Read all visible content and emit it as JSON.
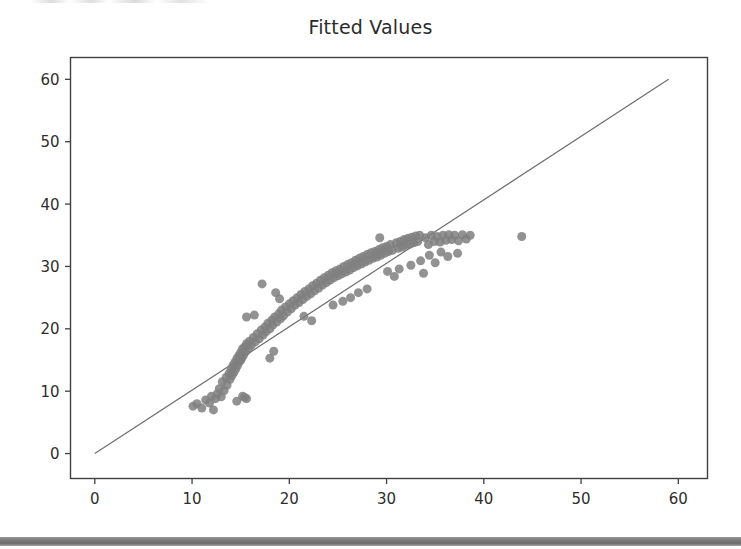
{
  "figure": {
    "title": "Fitted Values",
    "background_color": "#ffffff",
    "axes_color": "#404040",
    "tick_label_color": "#2e2e2e",
    "bottom_band_color": "#6f6f6f"
  },
  "chart_data": {
    "type": "scatter",
    "title": "Fitted Values",
    "xlabel": "",
    "ylabel": "",
    "xlim": [
      -2.5,
      63.0
    ],
    "ylim": [
      -4.0,
      63.5
    ],
    "xticks": [
      0,
      10,
      20,
      30,
      40,
      50,
      60
    ],
    "yticks": [
      0,
      10,
      20,
      30,
      40,
      50,
      60
    ],
    "xtick_labels": [
      "0",
      "10",
      "20",
      "30",
      "40",
      "50",
      "60"
    ],
    "ytick_labels": [
      "0",
      "10",
      "20",
      "30",
      "40",
      "50",
      "60"
    ],
    "grid": false,
    "legend": null,
    "marker": {
      "shape": "circle",
      "color": "#7f7f7f",
      "size": 9,
      "alpha": 0.85
    },
    "reference_line": {
      "name": "identity-line",
      "type": "line",
      "color": "#6e6e6e",
      "width": 1.2,
      "x": [
        0,
        59
      ],
      "y": [
        0,
        60
      ]
    },
    "series": [
      {
        "name": "observed-vs-fitted",
        "points": [
          [
            10.1,
            7.6
          ],
          [
            10.5,
            8.0
          ],
          [
            11.0,
            7.3
          ],
          [
            11.4,
            8.6
          ],
          [
            11.8,
            8.1
          ],
          [
            12.0,
            9.2
          ],
          [
            12.2,
            7.0
          ],
          [
            12.4,
            8.8
          ],
          [
            12.6,
            9.6
          ],
          [
            12.8,
            10.4
          ],
          [
            13.0,
            9.1
          ],
          [
            13.1,
            11.5
          ],
          [
            13.3,
            10.1
          ],
          [
            13.5,
            12.2
          ],
          [
            13.6,
            11.0
          ],
          [
            13.8,
            12.8
          ],
          [
            13.9,
            11.9
          ],
          [
            14.0,
            13.4
          ],
          [
            14.1,
            12.5
          ],
          [
            14.2,
            14.1
          ],
          [
            14.3,
            13.0
          ],
          [
            14.4,
            14.6
          ],
          [
            14.5,
            13.6
          ],
          [
            14.6,
            15.2
          ],
          [
            14.7,
            14.2
          ],
          [
            14.8,
            15.7
          ],
          [
            14.9,
            14.8
          ],
          [
            15.0,
            16.2
          ],
          [
            15.1,
            15.3
          ],
          [
            15.2,
            16.8
          ],
          [
            15.3,
            15.8
          ],
          [
            15.4,
            17.1
          ],
          [
            15.5,
            16.3
          ],
          [
            15.6,
            17.6
          ],
          [
            15.8,
            16.9
          ],
          [
            15.2,
            9.2
          ],
          [
            15.4,
            9.0
          ],
          [
            15.6,
            8.8
          ],
          [
            14.6,
            8.4
          ],
          [
            15.0,
            15.0
          ],
          [
            15.6,
            21.9
          ],
          [
            16.4,
            22.2
          ],
          [
            15.9,
            18.0
          ],
          [
            16.1,
            17.4
          ],
          [
            16.3,
            18.6
          ],
          [
            16.5,
            17.9
          ],
          [
            16.7,
            19.2
          ],
          [
            16.9,
            18.4
          ],
          [
            17.1,
            19.8
          ],
          [
            17.3,
            19.0
          ],
          [
            17.5,
            20.3
          ],
          [
            17.6,
            19.5
          ],
          [
            17.8,
            20.9
          ],
          [
            18.0,
            20.0
          ],
          [
            18.2,
            21.4
          ],
          [
            18.3,
            20.6
          ],
          [
            18.5,
            21.9
          ],
          [
            18.7,
            21.1
          ],
          [
            18.9,
            22.4
          ],
          [
            19.1,
            21.6
          ],
          [
            19.2,
            23.0
          ],
          [
            19.4,
            22.1
          ],
          [
            19.6,
            23.5
          ],
          [
            19.8,
            22.7
          ],
          [
            20.0,
            24.0
          ],
          [
            17.2,
            27.2
          ],
          [
            18.6,
            25.8
          ],
          [
            19.0,
            24.8
          ],
          [
            18.0,
            15.3
          ],
          [
            18.4,
            16.4
          ],
          [
            20.2,
            23.2
          ],
          [
            20.4,
            24.5
          ],
          [
            20.6,
            23.8
          ],
          [
            20.8,
            25.0
          ],
          [
            21.0,
            24.2
          ],
          [
            21.2,
            25.5
          ],
          [
            21.4,
            24.7
          ],
          [
            21.6,
            26.0
          ],
          [
            21.8,
            25.2
          ],
          [
            22.0,
            26.4
          ],
          [
            22.2,
            25.6
          ],
          [
            22.4,
            26.9
          ],
          [
            22.6,
            26.1
          ],
          [
            22.8,
            27.3
          ],
          [
            23.0,
            26.5
          ],
          [
            21.5,
            22.0
          ],
          [
            22.3,
            21.3
          ],
          [
            23.2,
            27.8
          ],
          [
            23.4,
            27.0
          ],
          [
            23.6,
            28.2
          ],
          [
            23.8,
            27.4
          ],
          [
            24.0,
            28.6
          ],
          [
            24.2,
            27.8
          ],
          [
            24.4,
            29.0
          ],
          [
            24.6,
            28.2
          ],
          [
            24.8,
            29.3
          ],
          [
            25.0,
            28.5
          ],
          [
            25.2,
            29.6
          ],
          [
            25.4,
            28.8
          ],
          [
            25.6,
            30.0
          ],
          [
            25.8,
            29.1
          ],
          [
            26.0,
            30.3
          ],
          [
            26.2,
            29.4
          ],
          [
            26.4,
            30.6
          ],
          [
            26.6,
            29.8
          ],
          [
            26.8,
            31.0
          ],
          [
            27.0,
            30.1
          ],
          [
            27.2,
            31.3
          ],
          [
            27.4,
            30.4
          ],
          [
            27.6,
            31.6
          ],
          [
            27.8,
            30.7
          ],
          [
            28.0,
            31.9
          ],
          [
            28.2,
            31.0
          ],
          [
            28.4,
            32.2
          ],
          [
            28.6,
            31.3
          ],
          [
            24.5,
            23.8
          ],
          [
            25.5,
            24.4
          ],
          [
            26.3,
            25.0
          ],
          [
            27.1,
            25.8
          ],
          [
            28.0,
            26.4
          ],
          [
            28.8,
            32.4
          ],
          [
            29.0,
            31.5
          ],
          [
            29.2,
            32.7
          ],
          [
            29.4,
            31.8
          ],
          [
            29.6,
            33.0
          ],
          [
            29.8,
            32.1
          ],
          [
            30.0,
            33.2
          ],
          [
            30.2,
            32.4
          ],
          [
            30.4,
            33.5
          ],
          [
            30.6,
            32.6
          ],
          [
            29.3,
            34.6
          ],
          [
            30.8,
            28.4
          ],
          [
            31.0,
            33.8
          ],
          [
            31.2,
            32.9
          ],
          [
            31.4,
            34.0
          ],
          [
            31.6,
            33.1
          ],
          [
            31.8,
            34.3
          ],
          [
            32.0,
            33.4
          ],
          [
            32.2,
            34.5
          ],
          [
            32.4,
            33.6
          ],
          [
            32.6,
            34.7
          ],
          [
            32.8,
            33.8
          ],
          [
            33.0,
            34.9
          ],
          [
            33.2,
            34.0
          ],
          [
            33.4,
            35.0
          ],
          [
            31.3,
            29.6
          ],
          [
            32.5,
            30.2
          ],
          [
            33.5,
            30.9
          ],
          [
            30.1,
            29.2
          ],
          [
            33.8,
            28.9
          ],
          [
            34.0,
            34.6
          ],
          [
            34.3,
            33.5
          ],
          [
            34.6,
            35.0
          ],
          [
            34.9,
            34.0
          ],
          [
            35.2,
            34.8
          ],
          [
            35.5,
            33.9
          ],
          [
            35.8,
            35.0
          ],
          [
            36.1,
            34.2
          ],
          [
            36.4,
            35.1
          ],
          [
            36.7,
            34.3
          ],
          [
            37.0,
            35.0
          ],
          [
            37.4,
            34.1
          ],
          [
            37.8,
            35.1
          ],
          [
            38.2,
            34.4
          ],
          [
            38.6,
            35.0
          ],
          [
            34.4,
            31.8
          ],
          [
            35.6,
            32.3
          ],
          [
            36.3,
            31.6
          ],
          [
            35.0,
            30.6
          ],
          [
            37.3,
            32.1
          ],
          [
            43.9,
            34.8
          ]
        ]
      }
    ]
  }
}
